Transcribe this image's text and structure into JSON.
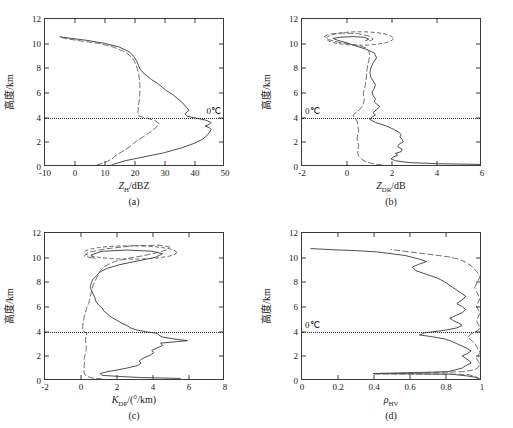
{
  "figure": {
    "axis_color": "#3a3a3a",
    "solid_curve_color": "#2b2b2b",
    "dashed_curve_color": "#555555",
    "background": "#ffffff",
    "y_axis_label": "高度/km",
    "freezing_label": "0℃"
  },
  "panels": [
    {
      "id": "a",
      "caption": "(a)",
      "xlabel_main": "Z",
      "xlabel_sub": "H",
      "xlabel_tail": "/dBZ",
      "xticks": [
        "-10",
        "0",
        "10",
        "20",
        "30",
        "40",
        "50"
      ],
      "yticks": [
        "0",
        "2",
        "4",
        "6",
        "8",
        "10",
        "12"
      ],
      "xlim": [
        -10,
        50
      ],
      "ylim": [
        0,
        12
      ],
      "freezing_height": 4,
      "freezing_label_align": "right",
      "has_ellipse": false
    },
    {
      "id": "b",
      "caption": "(b)",
      "xlabel_main": "Z",
      "xlabel_sub": "DR",
      "xlabel_tail": "/dB",
      "xticks": [
        "-2",
        "0",
        "2",
        "4",
        "6"
      ],
      "yticks": [
        "0",
        "2",
        "4",
        "6",
        "8",
        "10",
        "12"
      ],
      "xlim": [
        -2,
        6
      ],
      "ylim": [
        0,
        12
      ],
      "freezing_height": 4,
      "freezing_label_align": "left",
      "has_ellipse": true
    },
    {
      "id": "c",
      "caption": "(c)",
      "xlabel_main": "K",
      "xlabel_sub": "DP",
      "xlabel_tail": "/(°/km)",
      "xticks": [
        "-2",
        "0",
        "2",
        "4",
        "6",
        "8"
      ],
      "yticks": [
        "0",
        "2",
        "4",
        "6",
        "8",
        "10",
        "12"
      ],
      "xlim": [
        -2,
        8
      ],
      "ylim": [
        0,
        12
      ],
      "freezing_height": 4,
      "freezing_label_align": "none",
      "has_ellipse": true
    },
    {
      "id": "d",
      "caption": "(d)",
      "xlabel_main": "ρ",
      "xlabel_sub": "HV",
      "xlabel_tail": "",
      "xticks": [
        "0",
        "0.2",
        "0.4",
        "0.6",
        "0.8",
        "1"
      ],
      "yticks": [
        "0",
        "2",
        "4",
        "6",
        "8",
        "10",
        "12"
      ],
      "xlim": [
        0,
        1
      ],
      "ylim": [
        0,
        12
      ],
      "freezing_height": 4,
      "freezing_label_align": "left",
      "has_ellipse": false
    }
  ],
  "chart_data": [
    {
      "type": "line",
      "panel": "a",
      "title": "",
      "xlabel": "Z_H/dBZ",
      "ylabel": "高度/km",
      "xlim": [
        -10,
        50
      ],
      "ylim": [
        0,
        12
      ],
      "grid": false,
      "annotations": [
        "0℃ at 4 km (dotted horizontal line)"
      ],
      "series": [
        {
          "name": "solid",
          "style": "solid",
          "x": [
            12.5,
            13.5,
            15.0,
            17.0,
            22.0,
            30.0,
            36.0,
            40.5,
            43.0,
            44.5,
            45.5,
            46.0,
            45.5,
            44.0,
            45.5,
            46.0,
            44.0,
            41.0,
            38.0,
            37.2,
            38.5,
            37.5,
            36.0,
            34.5,
            33.0,
            31.0,
            29.5,
            28.0,
            26.0,
            24.5,
            23.0,
            22.0,
            21.5,
            21.0,
            20.0,
            18.5,
            15.0,
            10.0,
            4.0,
            -1.0,
            -4.0,
            -5.0
          ],
          "y": [
            0.0,
            0.1,
            0.2,
            0.35,
            0.6,
            1.0,
            1.4,
            1.8,
            2.1,
            2.4,
            2.7,
            2.9,
            3.05,
            3.2,
            3.35,
            3.5,
            3.7,
            3.85,
            4.0,
            4.2,
            4.5,
            4.8,
            5.2,
            5.5,
            5.8,
            6.1,
            6.4,
            6.7,
            7.0,
            7.3,
            7.6,
            7.9,
            8.2,
            8.5,
            8.9,
            9.3,
            9.7,
            10.0,
            10.25,
            10.4,
            10.5,
            10.55
          ]
        },
        {
          "name": "dashed",
          "style": "dashed",
          "x": [
            7.5,
            9.5,
            11.0,
            12.5,
            14.0,
            16.0,
            18.0,
            19.5,
            21.0,
            23.0,
            25.5,
            27.5,
            28.5,
            27.0,
            24.5,
            22.5,
            21.5,
            21.3,
            21.5,
            21.8,
            22.0,
            22.0,
            21.8,
            21.5,
            21.0,
            20.5,
            20.0,
            19.0,
            17.0,
            13.0,
            8.0,
            2.0,
            -2.0,
            -4.0,
            -5.0
          ],
          "y": [
            0.0,
            0.15,
            0.3,
            0.5,
            0.8,
            1.1,
            1.4,
            1.7,
            2.0,
            2.3,
            2.7,
            3.1,
            3.4,
            3.65,
            3.85,
            3.95,
            4.05,
            4.3,
            4.8,
            5.4,
            6.0,
            6.6,
            7.1,
            7.6,
            8.0,
            8.3,
            8.6,
            8.9,
            9.3,
            9.7,
            10.0,
            10.2,
            10.35,
            10.45,
            10.5
          ]
        }
      ]
    },
    {
      "type": "line",
      "panel": "b",
      "title": "",
      "xlabel": "Z_DR/dB",
      "ylabel": "高度/km",
      "xlim": [
        -2,
        6
      ],
      "ylim": [
        0,
        12
      ],
      "grid": false,
      "annotations": [
        "0℃ at 4 km (dotted horizontal line)",
        "dashed ellipse highlighting 9.8-11.0 km"
      ],
      "series": [
        {
          "name": "solid",
          "style": "solid",
          "x": [
            6.0,
            4.2,
            2.8,
            2.2,
            2.0,
            2.1,
            2.3,
            2.2,
            2.45,
            2.5,
            2.3,
            2.35,
            2.55,
            2.5,
            2.4,
            2.45,
            2.35,
            2.1,
            1.8,
            1.3,
            1.05,
            1.15,
            1.3,
            1.2,
            1.35,
            1.5,
            1.35,
            1.25,
            1.3,
            1.2,
            1.15,
            1.25,
            1.3,
            1.2,
            1.1,
            1.05,
            1.1,
            1.2,
            1.35,
            1.25,
            0.9,
            0.4,
            0.0,
            -0.4,
            -0.6,
            -0.3,
            0.3,
            0.8,
            1.0,
            0.85
          ],
          "y": [
            0.05,
            0.1,
            0.2,
            0.35,
            0.5,
            0.65,
            0.8,
            0.95,
            1.1,
            1.3,
            1.5,
            1.7,
            1.9,
            2.1,
            2.3,
            2.5,
            2.7,
            2.95,
            3.2,
            3.5,
            3.75,
            3.95,
            4.1,
            4.3,
            4.55,
            4.8,
            5.0,
            5.2,
            5.45,
            5.7,
            6.0,
            6.3,
            6.6,
            6.9,
            7.2,
            7.6,
            8.0,
            8.4,
            8.8,
            9.2,
            9.5,
            9.8,
            10.05,
            10.25,
            10.4,
            10.5,
            10.55,
            10.5,
            10.35,
            10.2
          ]
        },
        {
          "name": "dashed",
          "style": "dashed",
          "x": [
            1.6,
            1.2,
            0.9,
            0.7,
            0.55,
            0.5,
            0.52,
            0.55,
            0.5,
            0.48,
            0.5,
            0.55,
            0.52,
            0.5,
            0.48,
            0.45,
            0.4,
            0.35,
            0.3,
            0.35,
            0.5,
            0.65,
            0.75,
            0.8,
            0.78,
            0.75,
            0.8,
            0.85,
            0.88,
            0.9,
            0.92,
            0.95,
            1.0,
            1.05,
            1.0,
            0.9,
            0.6,
            0.1,
            -0.4,
            -0.8,
            -1.0,
            -0.8,
            -0.2,
            0.5,
            1.0,
            1.2,
            1.0
          ],
          "y": [
            0.0,
            0.1,
            0.25,
            0.45,
            0.7,
            1.0,
            1.3,
            1.6,
            1.9,
            2.2,
            2.5,
            2.8,
            3.1,
            3.35,
            3.55,
            3.7,
            3.85,
            3.95,
            4.05,
            4.2,
            4.4,
            4.7,
            5.0,
            5.3,
            5.6,
            5.9,
            6.2,
            6.6,
            7.0,
            7.4,
            7.8,
            8.2,
            8.6,
            9.0,
            9.35,
            9.6,
            9.8,
            9.95,
            10.1,
            10.3,
            10.55,
            10.75,
            10.85,
            10.8,
            10.6,
            10.35,
            10.15
          ]
        }
      ]
    },
    {
      "type": "line",
      "panel": "c",
      "title": "",
      "xlabel": "K_DP/(°/km)",
      "ylabel": "高度/km",
      "xlim": [
        -2,
        8
      ],
      "ylim": [
        0,
        12
      ],
      "grid": false,
      "annotations": [
        "0℃ at 4 km (dotted horizontal line)",
        "dashed ellipse highlighting 9.8-11.0 km"
      ],
      "series": [
        {
          "name": "solid",
          "style": "solid",
          "x": [
            5.6,
            3.4,
            2.3,
            1.2,
            1.1,
            1.5,
            2.1,
            2.6,
            3.2,
            3.4,
            3.3,
            3.5,
            3.9,
            4.1,
            4.0,
            4.3,
            4.6,
            4.5,
            6.0,
            5.2,
            4.6,
            4.4,
            4.3,
            3.6,
            3.1,
            2.8,
            2.6,
            2.3,
            2.0,
            1.7,
            1.5,
            1.3,
            1.2,
            1.0,
            0.85,
            0.8,
            0.7,
            0.6,
            0.55,
            0.6,
            0.7,
            0.9,
            1.1,
            1.5,
            2.2,
            3.2,
            4.2,
            4.6,
            4.0,
            2.6,
            1.2,
            0.6,
            0.8
          ],
          "y": [
            0.05,
            0.12,
            0.2,
            0.3,
            0.45,
            0.6,
            0.75,
            0.9,
            1.1,
            1.3,
            1.5,
            1.7,
            1.95,
            2.15,
            2.35,
            2.55,
            2.75,
            2.95,
            3.15,
            3.3,
            3.45,
            3.6,
            3.75,
            3.9,
            4.05,
            4.2,
            4.4,
            4.6,
            4.85,
            5.1,
            5.35,
            5.6,
            5.85,
            6.1,
            6.4,
            6.7,
            7.0,
            7.3,
            7.6,
            7.9,
            8.2,
            8.5,
            8.8,
            9.1,
            9.4,
            9.7,
            10.0,
            10.3,
            10.5,
            10.6,
            10.5,
            10.2,
            9.9
          ]
        },
        {
          "name": "dashed",
          "style": "dashed",
          "x": [
            1.2,
            0.6,
            0.3,
            0.2,
            0.18,
            0.2,
            0.22,
            0.2,
            0.25,
            0.3,
            0.32,
            0.3,
            0.28,
            0.3,
            0.35,
            0.2,
            0.1,
            0.12,
            0.15,
            0.2,
            0.28,
            0.35,
            0.45,
            0.5,
            0.55,
            0.6,
            0.65,
            0.7,
            0.8,
            0.9,
            1.0,
            1.1,
            1.3,
            1.6,
            2.0,
            2.6,
            3.4,
            4.2,
            4.8,
            5.0,
            4.4,
            3.0,
            1.4,
            0.4,
            0.2,
            0.8
          ],
          "y": [
            0.0,
            0.1,
            0.25,
            0.5,
            0.8,
            1.1,
            1.4,
            1.7,
            2.0,
            2.3,
            2.6,
            2.9,
            3.2,
            3.5,
            3.75,
            3.9,
            4.0,
            4.3,
            4.7,
            5.1,
            5.5,
            5.9,
            6.2,
            6.5,
            6.8,
            7.1,
            7.4,
            7.7,
            8.0,
            8.3,
            8.6,
            8.9,
            9.2,
            9.45,
            9.7,
            9.9,
            10.1,
            10.35,
            10.6,
            10.85,
            11.0,
            10.95,
            10.7,
            10.4,
            10.1,
            9.9
          ]
        }
      ]
    },
    {
      "type": "line",
      "panel": "d",
      "title": "",
      "xlabel": "ρ_HV",
      "ylabel": "高度/km",
      "xlim": [
        0,
        1
      ],
      "ylim": [
        0,
        12
      ],
      "grid": false,
      "annotations": [
        "0℃ at 4 km (dotted horizontal line)"
      ],
      "series": [
        {
          "name": "solid",
          "style": "solid",
          "x": [
            0.99,
            0.97,
            0.93,
            0.88,
            0.84,
            0.4,
            0.55,
            0.82,
            0.86,
            0.9,
            0.92,
            0.95,
            0.94,
            0.92,
            0.9,
            0.93,
            0.95,
            0.93,
            0.9,
            0.87,
            0.84,
            0.8,
            0.72,
            0.66,
            0.69,
            0.8,
            0.87,
            0.9,
            0.88,
            0.85,
            0.83,
            0.86,
            0.9,
            0.92,
            0.9,
            0.87,
            0.9,
            0.92,
            0.89,
            0.86,
            0.83,
            0.8,
            0.76,
            0.7,
            0.64,
            0.62,
            0.66,
            0.7,
            0.66,
            0.62,
            0.58,
            0.5,
            0.42,
            0.3,
            0.18,
            0.1,
            0.05
          ],
          "y": [
            0.05,
            0.15,
            0.25,
            0.33,
            0.4,
            0.45,
            0.5,
            0.6,
            0.75,
            0.9,
            1.1,
            1.3,
            1.5,
            1.7,
            1.9,
            2.1,
            2.3,
            2.5,
            2.7,
            2.9,
            3.1,
            3.3,
            3.5,
            3.62,
            3.8,
            4.0,
            4.2,
            4.4,
            4.6,
            4.8,
            5.0,
            5.2,
            5.45,
            5.7,
            5.95,
            6.2,
            6.5,
            6.8,
            7.1,
            7.4,
            7.7,
            8.0,
            8.3,
            8.6,
            8.9,
            9.2,
            9.45,
            9.65,
            9.85,
            10.0,
            10.15,
            10.3,
            10.45,
            10.55,
            10.62,
            10.68,
            10.72
          ]
        },
        {
          "name": "dashed",
          "style": "dashed",
          "x": [
            1.0,
            0.99,
            0.97,
            0.95,
            0.92,
            0.4,
            0.6,
            0.9,
            0.97,
            0.99,
            1.0,
            0.99,
            0.98,
            0.99,
            1.0,
            0.99,
            0.98,
            0.97,
            0.95,
            0.93,
            0.95,
            0.97,
            0.99,
            1.0,
            0.99,
            0.98,
            0.99,
            1.0,
            0.99,
            0.98,
            0.99,
            1.0,
            0.99,
            0.98,
            0.97,
            0.98,
            0.99,
            1.0,
            0.99,
            0.97,
            0.95,
            0.92,
            0.88,
            0.82,
            0.74,
            0.66,
            0.6,
            0.55,
            0.52,
            0.5
          ],
          "y": [
            0.0,
            0.1,
            0.2,
            0.3,
            0.38,
            0.42,
            0.48,
            0.6,
            0.75,
            0.95,
            1.2,
            1.45,
            1.7,
            1.95,
            2.2,
            2.45,
            2.7,
            2.95,
            3.2,
            3.45,
            3.7,
            3.85,
            4.0,
            4.25,
            4.5,
            4.8,
            5.1,
            5.4,
            5.7,
            6.0,
            6.3,
            6.6,
            6.9,
            7.2,
            7.5,
            7.8,
            8.1,
            8.4,
            8.7,
            9.0,
            9.3,
            9.6,
            9.85,
            10.05,
            10.2,
            10.35,
            10.45,
            10.55,
            10.6,
            10.65
          ]
        }
      ]
    }
  ]
}
